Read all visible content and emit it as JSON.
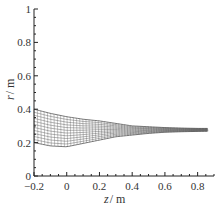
{
  "chart_data": {
    "type": "line",
    "title": "",
    "xlabel": "z/m",
    "ylabel": "r/m",
    "xlim": [
      -0.2,
      0.9
    ],
    "ylim": [
      0,
      1
    ],
    "x_ticks": [
      "-0.2",
      "0",
      "0.2",
      "0.4",
      "0.6",
      "0.8"
    ],
    "y_ticks": [
      "0",
      "0.2",
      "0.4",
      "0.6",
      "0.8",
      "1"
    ],
    "grid": false,
    "legend": null,
    "series": [
      {
        "name": "upper boundary",
        "x": [
          -0.2,
          -0.1,
          0.0,
          0.1,
          0.2,
          0.3,
          0.4,
          0.5,
          0.6,
          0.7,
          0.8,
          0.86
        ],
        "values": [
          0.4,
          0.375,
          0.355,
          0.34,
          0.33,
          0.315,
          0.3,
          0.295,
          0.29,
          0.287,
          0.285,
          0.285
        ]
      },
      {
        "name": "lower boundary",
        "x": [
          -0.2,
          -0.1,
          0.0,
          0.1,
          0.2,
          0.3,
          0.4,
          0.5,
          0.6,
          0.7,
          0.8,
          0.86
        ],
        "values": [
          0.2,
          0.18,
          0.175,
          0.195,
          0.215,
          0.235,
          0.245,
          0.255,
          0.262,
          0.265,
          0.267,
          0.268
        ]
      }
    ],
    "mesh": {
      "radial_lines": 12,
      "axial_lines": 70
    }
  },
  "axes": {
    "x_label_var": "z",
    "x_label_unit": "/ m",
    "y_label_var": "r",
    "y_label_unit": "/ m"
  }
}
